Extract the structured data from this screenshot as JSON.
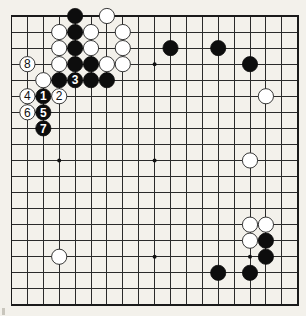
{
  "diagram": {
    "type": "go-board",
    "board_size": 19,
    "title": "",
    "colors": {
      "background": "#f3f1eb",
      "grid": "#2a2a2a",
      "black_stone": "#0d0d0d",
      "white_stone": "#ffffff"
    },
    "geometry": {
      "origin_x": 11.5,
      "origin_y": 16,
      "spacing_x": 15.9,
      "spacing_y": 16.05,
      "stone_radius": 7.6
    },
    "star_points": [
      [
        3,
        3
      ],
      [
        9,
        3
      ],
      [
        15,
        3
      ],
      [
        3,
        9
      ],
      [
        9,
        9
      ],
      [
        15,
        9
      ],
      [
        3,
        15
      ],
      [
        9,
        15
      ],
      [
        15,
        15
      ]
    ],
    "stones": [
      {
        "color": "black",
        "col": 4,
        "row": 0,
        "label": ""
      },
      {
        "color": "white",
        "col": 6,
        "row": 0,
        "label": ""
      },
      {
        "color": "white",
        "col": 3,
        "row": 1,
        "label": ""
      },
      {
        "color": "black",
        "col": 4,
        "row": 1,
        "label": ""
      },
      {
        "color": "white",
        "col": 5,
        "row": 1,
        "label": ""
      },
      {
        "color": "white",
        "col": 7,
        "row": 1,
        "label": ""
      },
      {
        "color": "white",
        "col": 3,
        "row": 2,
        "label": ""
      },
      {
        "color": "black",
        "col": 4,
        "row": 2,
        "label": ""
      },
      {
        "color": "white",
        "col": 5,
        "row": 2,
        "label": ""
      },
      {
        "color": "white",
        "col": 7,
        "row": 2,
        "label": ""
      },
      {
        "color": "white",
        "col": 1,
        "row": 3,
        "label": "8"
      },
      {
        "color": "white",
        "col": 3,
        "row": 3,
        "label": ""
      },
      {
        "color": "black",
        "col": 4,
        "row": 3,
        "label": ""
      },
      {
        "color": "black",
        "col": 5,
        "row": 3,
        "label": ""
      },
      {
        "color": "white",
        "col": 6,
        "row": 3,
        "label": ""
      },
      {
        "color": "white",
        "col": 7,
        "row": 3,
        "label": ""
      },
      {
        "color": "white",
        "col": 2,
        "row": 4,
        "label": ""
      },
      {
        "color": "black",
        "col": 3,
        "row": 4,
        "label": ""
      },
      {
        "color": "black",
        "col": 4,
        "row": 4,
        "label": "3"
      },
      {
        "color": "black",
        "col": 5,
        "row": 4,
        "label": ""
      },
      {
        "color": "black",
        "col": 6,
        "row": 4,
        "label": ""
      },
      {
        "color": "white",
        "col": 1,
        "row": 5,
        "label": "4"
      },
      {
        "color": "black",
        "col": 2,
        "row": 5,
        "label": "1"
      },
      {
        "color": "white",
        "col": 3,
        "row": 5,
        "label": "2"
      },
      {
        "color": "white",
        "col": 1,
        "row": 6,
        "label": "6"
      },
      {
        "color": "black",
        "col": 2,
        "row": 6,
        "label": "5"
      },
      {
        "color": "black",
        "col": 2,
        "row": 7,
        "label": "7"
      },
      {
        "color": "black",
        "col": 10,
        "row": 2,
        "label": ""
      },
      {
        "color": "black",
        "col": 13,
        "row": 2,
        "label": ""
      },
      {
        "color": "black",
        "col": 15,
        "row": 3,
        "label": ""
      },
      {
        "color": "white",
        "col": 16,
        "row": 5,
        "label": ""
      },
      {
        "color": "white",
        "col": 15,
        "row": 9,
        "label": ""
      },
      {
        "color": "white",
        "col": 15,
        "row": 13,
        "label": ""
      },
      {
        "color": "white",
        "col": 16,
        "row": 13,
        "label": ""
      },
      {
        "color": "white",
        "col": 15,
        "row": 14,
        "label": ""
      },
      {
        "color": "black",
        "col": 16,
        "row": 14,
        "label": ""
      },
      {
        "color": "black",
        "col": 16,
        "row": 15,
        "label": ""
      },
      {
        "color": "black",
        "col": 13,
        "row": 16,
        "label": ""
      },
      {
        "color": "black",
        "col": 15,
        "row": 16,
        "label": ""
      },
      {
        "color": "white",
        "col": 3,
        "row": 15,
        "label": ""
      }
    ],
    "move_sequence": [
      "1",
      "2",
      "3",
      "4",
      "5",
      "6",
      "7",
      "8"
    ]
  }
}
